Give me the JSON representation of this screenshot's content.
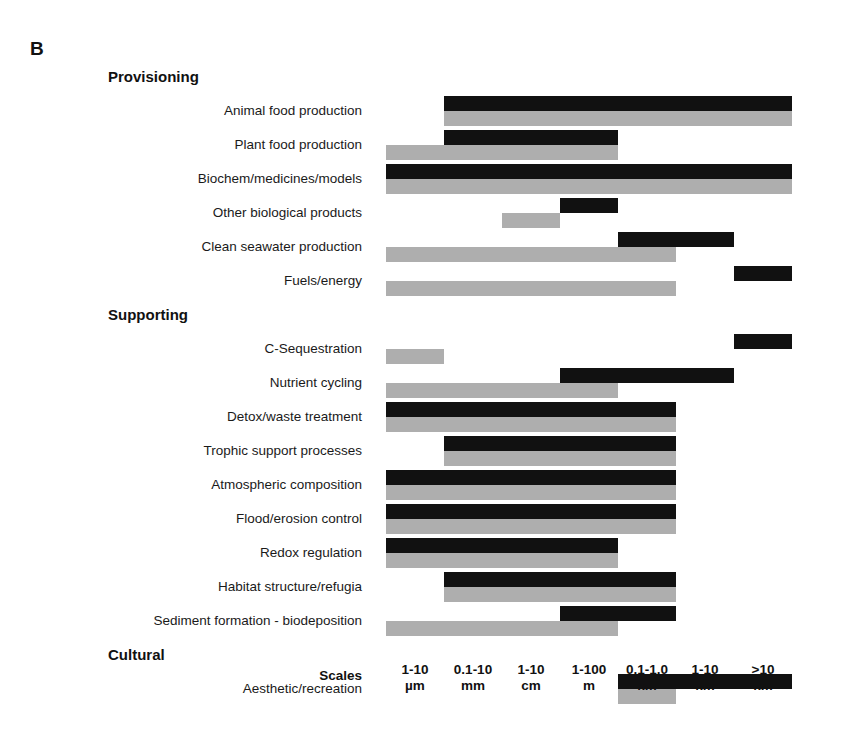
{
  "panel": {
    "letter": "B"
  },
  "axis": {
    "title": "Scales",
    "ticks": [
      {
        "line1": "1-10",
        "line2": "µm"
      },
      {
        "line1": "0.1-10",
        "line2": "mm"
      },
      {
        "line1": "1-10",
        "line2": "cm"
      },
      {
        "line1": "1-100",
        "line2": "m"
      },
      {
        "line1": "0.1-1.0",
        "line2": "km"
      },
      {
        "line1": "1-10",
        "line2": "km"
      },
      {
        "line1": ">10",
        "line2": "km"
      }
    ]
  },
  "colors": {
    "black_series": "#111111",
    "gray_series": "#aeaeae",
    "background": "#ffffff",
    "text": "#1a1a1a"
  },
  "rows": [
    {
      "kind": "group",
      "label": "Provisioning"
    },
    {
      "kind": "service",
      "label": "Animal food production"
    },
    {
      "kind": "service",
      "label": "Plant food production"
    },
    {
      "kind": "service",
      "label": "Biochem/medicines/models"
    },
    {
      "kind": "service",
      "label": "Other biological products"
    },
    {
      "kind": "service",
      "label": "Clean seawater production"
    },
    {
      "kind": "service",
      "label": "Fuels/energy"
    },
    {
      "kind": "group",
      "label": "Supporting"
    },
    {
      "kind": "service",
      "label": "C-Sequestration"
    },
    {
      "kind": "service",
      "label": "Nutrient cycling"
    },
    {
      "kind": "service",
      "label": "Detox/waste treatment"
    },
    {
      "kind": "service",
      "label": "Trophic support processes"
    },
    {
      "kind": "service",
      "label": "Atmospheric composition"
    },
    {
      "kind": "service",
      "label": "Flood/erosion control"
    },
    {
      "kind": "service",
      "label": "Redox regulation"
    },
    {
      "kind": "service",
      "label": "Habitat structure/refugia"
    },
    {
      "kind": "service",
      "label": "Sediment formation - biodeposition"
    },
    {
      "kind": "group",
      "label": "Cultural"
    },
    {
      "kind": "service",
      "label": "Aesthetic/recreation"
    }
  ],
  "chart_data": {
    "type": "bar",
    "title": "B",
    "xlabel": "Scales",
    "ylabel": "",
    "orientation": "horizontal",
    "note": "Each ecosystem service row has two stacked range bars (black = upper series, gray = lower series) spanning a contiguous set of spatial-scale columns.",
    "categories": [
      "1-10 µm",
      "0.1-10 mm",
      "1-10 cm",
      "1-100 m",
      "0.1-1.0 km",
      "1-10 km",
      ">10 km"
    ],
    "series_names": [
      "black",
      "gray"
    ],
    "groups": [
      "Provisioning",
      "Supporting",
      "Cultural"
    ],
    "items": [
      {
        "group": "Provisioning",
        "label": "Animal food production",
        "black": [
          2,
          7
        ],
        "gray": [
          2,
          7
        ]
      },
      {
        "group": "Provisioning",
        "label": "Plant food production",
        "black": [
          2,
          4
        ],
        "gray": [
          1,
          4
        ]
      },
      {
        "group": "Provisioning",
        "label": "Biochem/medicines/models",
        "black": [
          1,
          7
        ],
        "gray": [
          1,
          7
        ]
      },
      {
        "group": "Provisioning",
        "label": "Other biological products",
        "black": [
          4,
          4
        ],
        "gray": [
          3,
          3
        ]
      },
      {
        "group": "Provisioning",
        "label": "Clean seawater production",
        "black": [
          5,
          6
        ],
        "gray": [
          1,
          5
        ]
      },
      {
        "group": "Provisioning",
        "label": "Fuels/energy",
        "black": [
          7,
          7
        ],
        "gray": [
          1,
          5
        ]
      },
      {
        "group": "Supporting",
        "label": "C-Sequestration",
        "black": [
          7,
          7
        ],
        "gray": [
          1,
          1
        ]
      },
      {
        "group": "Supporting",
        "label": "Nutrient cycling",
        "black": [
          4,
          6
        ],
        "gray": [
          1,
          4
        ]
      },
      {
        "group": "Supporting",
        "label": "Detox/waste treatment",
        "black": [
          1,
          5
        ],
        "gray": [
          1,
          5
        ]
      },
      {
        "group": "Supporting",
        "label": "Trophic support processes",
        "black": [
          2,
          5
        ],
        "gray": [
          2,
          5
        ]
      },
      {
        "group": "Supporting",
        "label": "Atmospheric composition",
        "black": [
          1,
          5
        ],
        "gray": [
          1,
          5
        ]
      },
      {
        "group": "Supporting",
        "label": "Flood/erosion control",
        "black": [
          1,
          5
        ],
        "gray": [
          1,
          5
        ]
      },
      {
        "group": "Supporting",
        "label": "Redox regulation",
        "black": [
          1,
          4
        ],
        "gray": [
          1,
          4
        ]
      },
      {
        "group": "Supporting",
        "label": "Habitat structure/refugia",
        "black": [
          2,
          5
        ],
        "gray": [
          2,
          5
        ]
      },
      {
        "group": "Supporting",
        "label": "Sediment formation - biodeposition",
        "black": [
          4,
          5
        ],
        "gray": [
          1,
          4
        ]
      },
      {
        "group": "Cultural",
        "label": "Aesthetic/recreation",
        "black": [
          5,
          7
        ],
        "gray": [
          5,
          5
        ]
      }
    ]
  }
}
